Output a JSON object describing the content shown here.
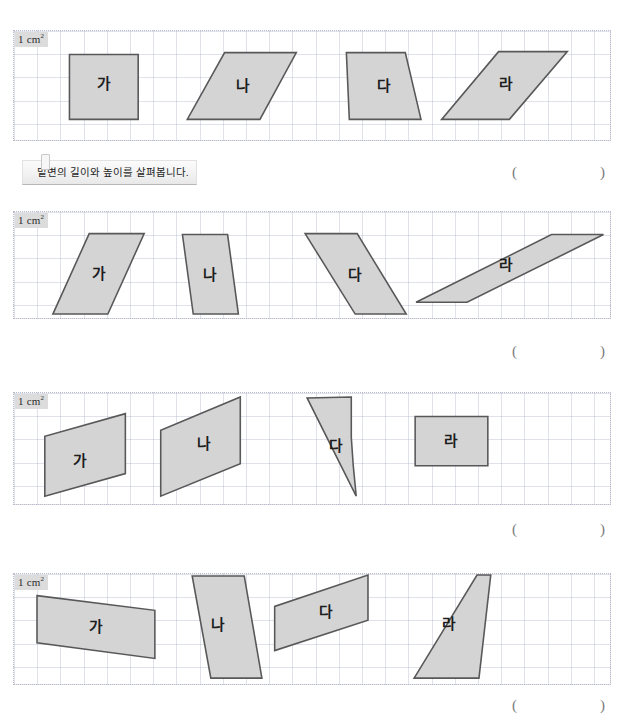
{
  "page": {
    "width": 631,
    "height": 724,
    "background": "#ffffff",
    "shape_fill": "#d4d4d4",
    "shape_stroke": "#585858",
    "grid_line_color": "#96a0be",
    "unit_badge_bg": "#dcdcdc"
  },
  "unit_label": {
    "value": "1 cm",
    "exponent": "2"
  },
  "instruction": {
    "text": "밑변의 길이와 높이를 살펴봅니다."
  },
  "answer_field": {
    "open": "(",
    "close": ")"
  },
  "blocks": [
    {
      "id": "block-1",
      "panel": {
        "x": 13,
        "y": 30,
        "w": 598,
        "h": 111
      },
      "shapes": [
        {
          "label": "가",
          "points": "52,24 122,24 122,90 52,90",
          "label_x": 87,
          "label_y": 55
        },
        {
          "label": "나",
          "points": "210,22 283,22 246,90 172,90",
          "label_x": 229,
          "label_y": 57
        },
        {
          "label": "다",
          "points": "334,22 394,22 410,90 337,90",
          "label_x": 372,
          "label_y": 57
        },
        {
          "label": "라",
          "points": "489,21 559,21 500,90 431,90",
          "label_x": 497,
          "label_y": 55
        }
      ]
    },
    {
      "id": "block-2",
      "panel": {
        "x": 13,
        "y": 211,
        "w": 598,
        "h": 108
      },
      "shapes": [
        {
          "label": "가",
          "points": "72,22 128,22 91,104 35,104",
          "label_x": 82,
          "label_y": 64
        },
        {
          "label": "나",
          "points": "167,23 213,23 224,104 178,104",
          "label_x": 195,
          "label_y": 65
        },
        {
          "label": "다",
          "points": "292,22 345,22 395,104 343,104",
          "label_x": 343,
          "label_y": 65
        },
        {
          "label": "라",
          "points": "543,23 596,23 457,92 405,92",
          "label_x": 497,
          "label_y": 55
        }
      ]
    },
    {
      "id": "block-3",
      "panel": {
        "x": 13,
        "y": 392,
        "w": 598,
        "h": 113
      },
      "shapes": [
        {
          "label": "가",
          "points": "109,21 109,82 27,105 27,44",
          "label_x": 63,
          "label_y": 70
        },
        {
          "label": "나",
          "points": "226,4 226,72 145,105 145,38",
          "label_x": 189,
          "label_y": 53
        },
        {
          "label": "다",
          "points": "339,4 339,45 341,74 344,105 294,5",
          "label_x": 323,
          "label_y": 55
        },
        {
          "label": "라",
          "points": "404,24 478,24 478,74 404,74",
          "label_x": 441,
          "label_y": 50
        }
      ]
    },
    {
      "id": "block-4",
      "panel": {
        "x": 13,
        "y": 573,
        "w": 598,
        "h": 112
      },
      "shapes": [
        {
          "label": "가",
          "points": "19,22 139,37 139,86 19,70",
          "label_x": 79,
          "label_y": 55
        },
        {
          "label": "나",
          "points": "177,2 230,2 248,106 196,106",
          "label_x": 203,
          "label_y": 53
        },
        {
          "label": "다",
          "points": "356,1 356,47 261,78 261,33",
          "label_x": 313,
          "label_y": 40
        },
        {
          "label": "라",
          "points": "467,1 481,1 469,106 403,106",
          "label_x": 439,
          "label_y": 52
        }
      ]
    }
  ]
}
